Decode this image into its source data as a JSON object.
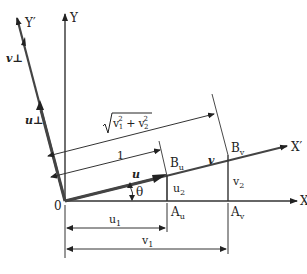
{
  "diagram": {
    "type": "coordinate-rotation",
    "axes": {
      "x": "X",
      "y": "Y",
      "x_prime": "X′",
      "y_prime": "Y′"
    },
    "origin_label": "0",
    "vectors": {
      "u": "u",
      "v": "v",
      "u_perp": "u⊥",
      "v_perp": "v⊥"
    },
    "points": {
      "Bu_main": "B",
      "Bu_sub": "u",
      "Bv_main": "B",
      "Bv_sub": "v",
      "Au_main": "A",
      "Au_sub": "u",
      "Av_main": "A",
      "Av_sub": "v"
    },
    "components": {
      "u2_main": "u",
      "u2_sub": "2",
      "v2_main": "v",
      "v2_sub": "2",
      "u1_main": "u",
      "u1_sub": "1",
      "v1_main": "v",
      "v1_sub": "1"
    },
    "dimensions": {
      "unit_length": "1",
      "magnitude_v": "√(v1² + v2²)",
      "magnitude_v1": "v",
      "magnitude_v1_sub": "1",
      "magnitude_v1_sup": "2",
      "magnitude_plus": "+",
      "magnitude_v2": "v",
      "magnitude_v2_sub": "2",
      "magnitude_v2_sup": "2"
    },
    "angle_label": "θ",
    "colors": {
      "line": "#333333",
      "thick": "#444444",
      "background": "#ffffff"
    }
  }
}
